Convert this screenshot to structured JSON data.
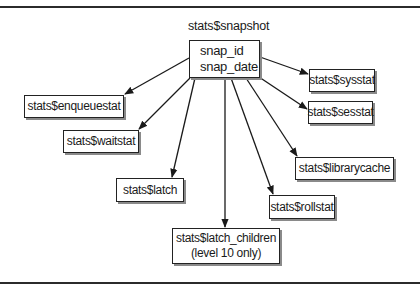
{
  "diagram": {
    "root": {
      "title": "stats$snapshot",
      "fields": [
        "snap_id",
        "snap_date"
      ]
    },
    "children": [
      {
        "id": "enqueuestat",
        "lines": [
          "stats$enqueuestat"
        ]
      },
      {
        "id": "waitstat",
        "lines": [
          "stats$waitstat"
        ]
      },
      {
        "id": "latch",
        "lines": [
          "stats$latch"
        ]
      },
      {
        "id": "latch-children",
        "lines": [
          "stats$latch_children",
          "(level 10 only)"
        ]
      },
      {
        "id": "rollstat",
        "lines": [
          "stats$rollstat"
        ]
      },
      {
        "id": "librarycache",
        "lines": [
          "stats$librarycache"
        ]
      },
      {
        "id": "sesstat",
        "lines": [
          "stats$sesstat"
        ]
      },
      {
        "id": "sysstat",
        "lines": [
          "stats$sysstat"
        ]
      }
    ],
    "edges": [
      {
        "from": "snapshot",
        "to": "enqueuestat"
      },
      {
        "from": "snapshot",
        "to": "waitstat"
      },
      {
        "from": "snapshot",
        "to": "latch"
      },
      {
        "from": "snapshot",
        "to": "latch-children"
      },
      {
        "from": "snapshot",
        "to": "rollstat"
      },
      {
        "from": "snapshot",
        "to": "librarycache"
      },
      {
        "from": "snapshot",
        "to": "sesstat"
      },
      {
        "from": "snapshot",
        "to": "sysstat"
      }
    ]
  }
}
